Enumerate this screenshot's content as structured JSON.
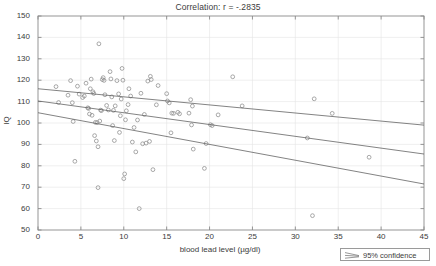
{
  "chart_data": {
    "type": "scatter",
    "title": "Correlation: r = -.2835",
    "xlabel": "blood lead level (µg/dl)",
    "ylabel": "IQ",
    "xlim": [
      0,
      45
    ],
    "ylim": [
      50,
      150
    ],
    "xticks": [
      0,
      5,
      10,
      15,
      20,
      25,
      30,
      35,
      40,
      45
    ],
    "yticks": [
      50,
      60,
      70,
      80,
      90,
      100,
      110,
      120,
      130,
      140,
      150
    ],
    "grid": true,
    "legend_position": "bottom-right",
    "legend_entries": [
      "95% confidence"
    ],
    "marker": "open-circle",
    "marker_color": "#8c8c8c",
    "line_color": "#5a5a5a",
    "axis_color": "#8a8a8a",
    "grid_color": "#e4e4e4",
    "text_color": "#3b3b3b",
    "series": [
      {
        "name": "observations",
        "points": [
          [
            2.1,
            117.0
          ],
          [
            2.4,
            109.6
          ],
          [
            3.5,
            113.0
          ],
          [
            3.8,
            119.8
          ],
          [
            4.0,
            109.5
          ],
          [
            4.1,
            100.7
          ],
          [
            4.3,
            82.1
          ],
          [
            4.6,
            117.2
          ],
          [
            4.8,
            113.5
          ],
          [
            5.2,
            111.9
          ],
          [
            5.4,
            112.6
          ],
          [
            5.6,
            118.6
          ],
          [
            5.8,
            107.1
          ],
          [
            5.9,
            106.8
          ],
          [
            6.0,
            104.2
          ],
          [
            6.1,
            116.0
          ],
          [
            6.2,
            120.5
          ],
          [
            6.3,
            103.6
          ],
          [
            6.4,
            114.6
          ],
          [
            6.5,
            113.8
          ],
          [
            6.6,
            94.1
          ],
          [
            6.7,
            100.3
          ],
          [
            6.8,
            91.6
          ],
          [
            6.9,
            100.2
          ],
          [
            7.0,
            69.8
          ],
          [
            7.0,
            88.9
          ],
          [
            7.1,
            137.0
          ],
          [
            7.2,
            100.9
          ],
          [
            7.3,
            106.0
          ],
          [
            7.4,
            105.8
          ],
          [
            7.5,
            120.3
          ],
          [
            7.6,
            121.2
          ],
          [
            7.7,
            119.9
          ],
          [
            7.8,
            113.2
          ],
          [
            8.0,
            108.2
          ],
          [
            8.2,
            106.1
          ],
          [
            8.4,
            124.0
          ],
          [
            8.5,
            120.6
          ],
          [
            8.6,
            112.2
          ],
          [
            8.7,
            98.8
          ],
          [
            8.8,
            105.9
          ],
          [
            8.9,
            91.8
          ],
          [
            9.0,
            108.0
          ],
          [
            9.2,
            119.8
          ],
          [
            9.4,
            113.6
          ],
          [
            9.5,
            95.6
          ],
          [
            9.6,
            103.4
          ],
          [
            9.7,
            111.2
          ],
          [
            9.8,
            125.5
          ],
          [
            9.9,
            120.0
          ],
          [
            10.0,
            74.0
          ],
          [
            10.1,
            76.2
          ],
          [
            10.2,
            101.5
          ],
          [
            10.3,
            105.7
          ],
          [
            10.5,
            108.6
          ],
          [
            10.6,
            116.0
          ],
          [
            10.8,
            112.6
          ],
          [
            11.0,
            91.1
          ],
          [
            11.2,
            97.9
          ],
          [
            11.4,
            86.5
          ],
          [
            11.6,
            101.4
          ],
          [
            11.8,
            60.0
          ],
          [
            12.0,
            113.9
          ],
          [
            12.2,
            90.3
          ],
          [
            12.4,
            104.0
          ],
          [
            12.6,
            90.6
          ],
          [
            12.8,
            119.6
          ],
          [
            13.0,
            91.4
          ],
          [
            13.1,
            121.8
          ],
          [
            13.2,
            120.3
          ],
          [
            13.4,
            78.2
          ],
          [
            13.8,
            108.5
          ],
          [
            14.0,
            117.5
          ],
          [
            15.0,
            113.7
          ],
          [
            15.1,
            110.3
          ],
          [
            15.3,
            109.4
          ],
          [
            15.5,
            95.4
          ],
          [
            15.6,
            104.6
          ],
          [
            15.8,
            104.5
          ],
          [
            16.3,
            105.0
          ],
          [
            16.5,
            104.3
          ],
          [
            17.6,
            104.6
          ],
          [
            17.8,
            110.9
          ],
          [
            17.9,
            99.1
          ],
          [
            18.0,
            107.9
          ],
          [
            18.1,
            87.8
          ],
          [
            19.4,
            78.8
          ],
          [
            19.6,
            90.4
          ],
          [
            20.1,
            99.2
          ],
          [
            20.3,
            98.8
          ],
          [
            21.0,
            103.8
          ],
          [
            22.7,
            121.6
          ],
          [
            23.8,
            108.0
          ],
          [
            31.4,
            93.0
          ],
          [
            32.0,
            56.7
          ],
          [
            32.2,
            111.3
          ],
          [
            34.3,
            104.5
          ],
          [
            38.6,
            84.0
          ]
        ]
      }
    ],
    "fit_lines": [
      {
        "name": "upper-confidence",
        "x0": 0,
        "y0": 116.0,
        "x1": 45,
        "y1": 99.0
      },
      {
        "name": "regression",
        "x0": 0,
        "y0": 110.3,
        "x1": 45,
        "y1": 85.5
      },
      {
        "name": "lower-confidence",
        "x0": 0,
        "y0": 104.8,
        "x1": 45,
        "y1": 71.5
      }
    ]
  }
}
